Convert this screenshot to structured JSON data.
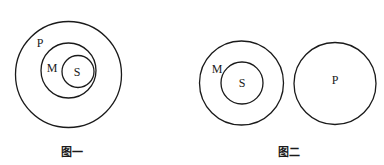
{
  "figures": [
    {
      "caption": "图一",
      "description": "S inside M inside P (nested circles)",
      "circles": [
        {
          "name": "P",
          "cx": 68.5,
          "cy": 74.5,
          "r": 53,
          "label": "P",
          "label_x": 40,
          "label_y": 43
        },
        {
          "name": "M",
          "cx": 68.5,
          "cy": 70.5,
          "r": 27.5,
          "label": "M",
          "label_x": 52,
          "label_y": 68
        },
        {
          "name": "S",
          "cx": 78,
          "cy": 71.5,
          "r": 16,
          "label": "S",
          "label_x": 77,
          "label_y": 72
        }
      ],
      "caption_x": 72,
      "caption_y": 152
    },
    {
      "caption": "图二",
      "description": "S inside M; P disjoint",
      "circles": [
        {
          "name": "M",
          "cx": 241.5,
          "cy": 83,
          "r": 42,
          "label": "M",
          "label_x": 217,
          "label_y": 69
        },
        {
          "name": "S",
          "cx": 242,
          "cy": 83,
          "r": 21,
          "label": "S",
          "label_x": 242,
          "label_y": 83
        },
        {
          "name": "P",
          "cx": 335,
          "cy": 83.5,
          "r": 41,
          "label": "P",
          "label_x": 335,
          "label_y": 80
        }
      ],
      "caption_x": 289,
      "caption_y": 152
    }
  ],
  "colors": {
    "stroke": "#1a1a1a",
    "background": "#ffffff"
  }
}
